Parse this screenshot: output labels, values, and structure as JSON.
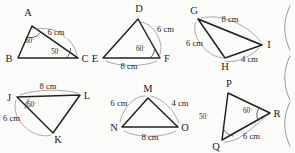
{
  "figure": {
    "background_color": "#fbfbfa",
    "stroke_color": "#2b2b2b",
    "annotation_color": "#7e7e7e",
    "units": "cm",
    "count": 6
  },
  "triangles": [
    {
      "id": "abc",
      "vertices": [
        "A",
        "B",
        "C"
      ],
      "labels": {
        "v1": "A",
        "v2": "B",
        "v3": "C"
      },
      "measures": [
        {
          "name": "angle-a",
          "text": "60",
          "symbol": "°",
          "full": "60°"
        },
        {
          "name": "angle-c",
          "text": "50",
          "symbol": "°",
          "full": "50°"
        },
        {
          "name": "side-ac",
          "text": "6 cm"
        }
      ]
    },
    {
      "id": "def",
      "vertices": [
        "D",
        "E",
        "F"
      ],
      "labels": {
        "v1": "D",
        "v2": "E",
        "v3": "F"
      },
      "measures": [
        {
          "name": "side-df",
          "text": "6 cm"
        },
        {
          "name": "angle-f",
          "text": "60",
          "symbol": "°",
          "full": "60°"
        },
        {
          "name": "side-ef",
          "text": "8 cm"
        }
      ]
    },
    {
      "id": "ghi",
      "vertices": [
        "G",
        "H",
        "I"
      ],
      "labels": {
        "v1": "G",
        "v2": "H",
        "v3": "I"
      },
      "measures": [
        {
          "name": "side-gi",
          "text": "8 cm"
        },
        {
          "name": "side-gh",
          "text": "6 cm"
        },
        {
          "name": "side-hi",
          "text": "4 cm"
        }
      ]
    },
    {
      "id": "jkl",
      "vertices": [
        "J",
        "K",
        "L"
      ],
      "labels": {
        "v1": "J",
        "v2": "K",
        "v3": "L"
      },
      "measures": [
        {
          "name": "side-jl",
          "text": "8 cm"
        },
        {
          "name": "angle-j",
          "text": "60",
          "symbol": "°",
          "full": "60°"
        },
        {
          "name": "side-jk",
          "text": "6 cm"
        }
      ]
    },
    {
      "id": "mno",
      "vertices": [
        "M",
        "N",
        "O"
      ],
      "labels": {
        "v1": "M",
        "v2": "N",
        "v3": "O"
      },
      "measures": [
        {
          "name": "side-mn",
          "text": "6 cm"
        },
        {
          "name": "side-mo",
          "text": "4 cm"
        },
        {
          "name": "side-no",
          "text": "8 cm"
        }
      ]
    },
    {
      "id": "pqr",
      "vertices": [
        "P",
        "Q",
        "R"
      ],
      "labels": {
        "v1": "P",
        "v2": "Q",
        "v3": "R"
      },
      "measures": [
        {
          "name": "angle-q",
          "text": "50",
          "symbol": "°",
          "full": "50°"
        },
        {
          "name": "angle-r",
          "text": "60",
          "symbol": "°",
          "full": "60°"
        },
        {
          "name": "side-qr",
          "text": "6 cm"
        }
      ]
    }
  ]
}
